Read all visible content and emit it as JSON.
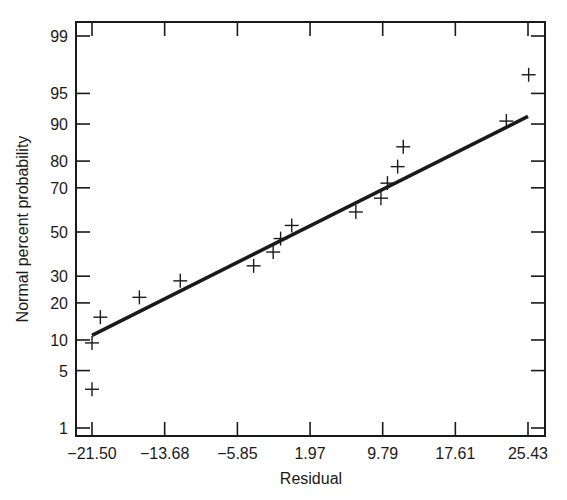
{
  "chart_data": {
    "type": "scatter",
    "title": "",
    "xlabel": "Residual",
    "ylabel": "Normal percent probability",
    "x_scale": "linear",
    "y_scale": "normal-probability",
    "xlim": [
      -23.1,
      27.1
    ],
    "ylim": [
      0.5,
      99.6
    ],
    "grid": false,
    "legend": null,
    "x_ticks": [
      -21.5,
      -13.68,
      -5.85,
      1.97,
      9.79,
      17.61,
      25.43
    ],
    "x_tick_labels": [
      "−21.50",
      "−13.68",
      "−5.85",
      "1.97",
      "9.79",
      "17.61",
      "25.43"
    ],
    "y_ticks": [
      1,
      5,
      10,
      20,
      30,
      50,
      70,
      80,
      90,
      95,
      99
    ],
    "y_tick_labels": [
      "1",
      "5",
      "10",
      "20",
      "30",
      "50",
      "70",
      "80",
      "90",
      "95",
      "99"
    ],
    "series": [
      {
        "name": "Residuals",
        "marker": "+",
        "points": [
          {
            "x": -21.5,
            "y": 3.1
          },
          {
            "x": -21.5,
            "y": 9.4
          },
          {
            "x": -20.6,
            "y": 15.6
          },
          {
            "x": -16.4,
            "y": 21.9
          },
          {
            "x": -12.0,
            "y": 28.1
          },
          {
            "x": -4.1,
            "y": 34.4
          },
          {
            "x": -2.0,
            "y": 40.6
          },
          {
            "x": -1.2,
            "y": 46.9
          },
          {
            "x": 0.0,
            "y": 53.1
          },
          {
            "x": 6.9,
            "y": 59.4
          },
          {
            "x": 9.6,
            "y": 65.6
          },
          {
            "x": 10.3,
            "y": 71.9
          },
          {
            "x": 11.4,
            "y": 78.1
          },
          {
            "x": 12.0,
            "y": 84.4
          },
          {
            "x": 23.1,
            "y": 90.6
          },
          {
            "x": 25.5,
            "y": 96.9
          }
        ]
      },
      {
        "name": "Fitted normal line",
        "type": "line",
        "points": [
          {
            "x": -21.5,
            "y": 11.0
          },
          {
            "x": 25.43,
            "y": 91.5
          }
        ]
      }
    ]
  },
  "colors": {
    "ink": "#1a1a1a",
    "background": "#ffffff"
  }
}
